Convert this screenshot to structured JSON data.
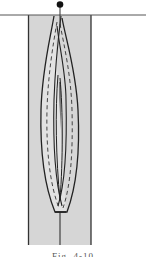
{
  "figure": {
    "type": "sewing-diagram",
    "colors": {
      "background": "#ffffff",
      "fabric": "#d9d9d9",
      "outline": "#222222",
      "stitch": "#ffffff",
      "pin_head": "#111111"
    },
    "elements": {
      "edge_line": "horizontal edge line",
      "pin": "pin",
      "fabric_strip": "fabric strip",
      "loops": "crossed loops",
      "stitch_lines": "dashed stitch lines",
      "center_line": "center line"
    }
  },
  "caption": {
    "text": "Fig. 4-10"
  }
}
